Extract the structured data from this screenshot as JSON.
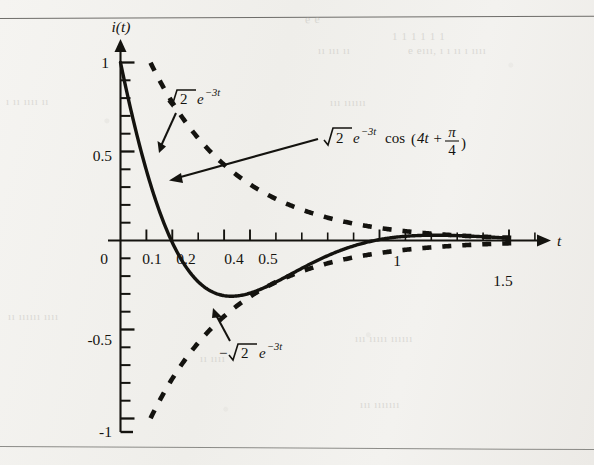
{
  "figure": {
    "kind": "damped-sinusoid-plot",
    "paper_color": "#f2f1ee",
    "ink_color": "#14130f",
    "axis": {
      "y_axis_label": "i(t)",
      "x_axis_label": "t",
      "x_ticks_labeled": [
        "0",
        "0.1",
        "0.2",
        "0.4",
        "0.5",
        "1",
        "1.5"
      ],
      "y_ticks_labeled": [
        "1",
        "0.5",
        "-0.5",
        "-1"
      ],
      "x_minor_tick_step": "0.1",
      "y_minor_tick_step": "0.1",
      "x_range_min": "0",
      "x_range_max": "1.6",
      "y_range_min": "-1",
      "y_range_max": "1"
    },
    "annotations": {
      "upper_envelope": {
        "radical": "√2",
        "base": "e",
        "exponent": "−3t",
        "full": "√2 e^{-3t}",
        "style": "dashed"
      },
      "lower_envelope": {
        "sign": "−",
        "radical": "√2",
        "base": "e",
        "exponent": "−3t",
        "full": "−√2 e^{-3t}",
        "style": "dashed"
      },
      "main_curve": {
        "radical": "√2",
        "base": "e",
        "exponent": "−3t",
        "trig": "cos",
        "arg_open": "(",
        "arg_main": "4t +",
        "frac_num": "π",
        "frac_den": "4",
        "arg_close": ")",
        "full": "√2 e^{-3t} cos(4t + π/4)",
        "style": "solid"
      }
    },
    "bleed_through_marks": [
      {
        "text": "e e",
        "x": 305,
        "y": 12,
        "size": 12,
        "rot": -1
      },
      {
        "text": "1 1 1 1 1 1",
        "x": 392,
        "y": 30,
        "size": 11,
        "rot": 0
      },
      {
        "text": "ıı ııı ıı",
        "x": 318,
        "y": 44,
        "size": 11,
        "rot": 0
      },
      {
        "text": "e eııı, ı ı ıı ı ıııı",
        "x": 408,
        "y": 44,
        "size": 11,
        "rot": 0
      },
      {
        "text": "ı ıı ıııı ıı",
        "x": 6,
        "y": 95,
        "size": 11,
        "rot": 0
      },
      {
        "text": "ııı ıııııı",
        "x": 330,
        "y": 96,
        "size": 11,
        "rot": 0
      },
      {
        "text": "ıı ıııııı ıııı",
        "x": 8,
        "y": 310,
        "size": 11,
        "rot": 0
      },
      {
        "text": "ııı ııııı ıııııı",
        "x": 355,
        "y": 332,
        "size": 11,
        "rot": 0
      },
      {
        "text": "ııı ııııııı",
        "x": 360,
        "y": 398,
        "size": 11,
        "rot": 0
      },
      {
        "text": "ıı ıııı",
        "x": 200,
        "y": 352,
        "size": 11,
        "rot": 0
      }
    ]
  },
  "chart_data": {
    "type": "line",
    "title": "",
    "xlabel": "t",
    "ylabel": "i(t)",
    "xlim": [
      0,
      1.6
    ],
    "ylim": [
      -1,
      1
    ],
    "grid": false,
    "legend": "inline-annotations",
    "xticks": [
      0,
      0.1,
      0.2,
      0.3,
      0.4,
      0.5,
      0.6,
      0.7,
      0.8,
      0.9,
      1.0,
      1.1,
      1.2,
      1.3,
      1.4,
      1.5,
      1.6
    ],
    "xtick_labels": [
      "0",
      "0.1",
      "0.2",
      "",
      "0.4",
      "0.5",
      "",
      "",
      "",
      "",
      "1",
      "",
      "",
      "",
      "",
      "1.5",
      ""
    ],
    "yticks": [
      -1,
      -0.9,
      -0.8,
      -0.7,
      -0.6,
      -0.5,
      -0.4,
      -0.3,
      -0.2,
      -0.1,
      0,
      0.1,
      0.2,
      0.3,
      0.4,
      0.5,
      0.6,
      0.7,
      0.8,
      0.9,
      1.0
    ],
    "ytick_labels": [
      "-1",
      "",
      "",
      "",
      "",
      "-0.5",
      "",
      "",
      "",
      "",
      "",
      "",
      "",
      "",
      "",
      "0.5",
      "",
      "",
      "",
      "",
      "1"
    ],
    "series": [
      {
        "name": "√2 e^{-3t} cos(4t + π/4)",
        "style": "solid",
        "formula_sqrt2": 1.41421356,
        "formula_decay": 3,
        "formula_omega": 4,
        "formula_phase_pi_over": 4,
        "x": [
          0.0,
          0.05,
          0.1,
          0.15,
          0.2,
          0.25,
          0.3,
          0.35,
          0.4,
          0.45,
          0.5,
          0.55,
          0.6,
          0.65,
          0.7,
          0.75,
          0.8,
          0.85,
          0.9,
          0.95,
          1.0,
          1.05,
          1.1,
          1.15,
          1.2,
          1.25,
          1.3,
          1.35,
          1.4,
          1.45,
          1.5,
          1.55,
          1.6
        ],
        "y": [
          1.0,
          0.823,
          0.639,
          0.462,
          0.3,
          0.159,
          0.043,
          -0.048,
          -0.113,
          -0.156,
          -0.179,
          -0.186,
          -0.181,
          -0.168,
          -0.149,
          -0.127,
          -0.104,
          -0.081,
          -0.059,
          -0.039,
          -0.022,
          -0.007,
          0.005,
          0.014,
          0.021,
          0.025,
          0.028,
          0.029,
          0.029,
          0.028,
          0.026,
          0.024,
          0.021
        ]
      },
      {
        "name": "√2 e^{-3t}",
        "style": "dashed",
        "x": [
          0.0,
          0.1,
          0.2,
          0.3,
          0.4,
          0.5,
          0.6,
          0.7,
          0.8,
          0.9,
          1.0,
          1.1,
          1.2,
          1.3,
          1.4,
          1.5,
          1.6
        ],
        "y": [
          1.414,
          1.048,
          0.776,
          0.575,
          0.426,
          0.316,
          0.234,
          0.173,
          0.128,
          0.095,
          0.07,
          0.052,
          0.039,
          0.029,
          0.021,
          0.016,
          0.012
        ]
      },
      {
        "name": "−√2 e^{-3t}",
        "style": "dashed",
        "x": [
          0.0,
          0.1,
          0.2,
          0.3,
          0.4,
          0.5,
          0.6,
          0.7,
          0.8,
          0.9,
          1.0,
          1.1,
          1.2,
          1.3,
          1.4,
          1.5,
          1.6
        ],
        "y": [
          -1.414,
          -1.048,
          -0.776,
          -0.575,
          -0.426,
          -0.316,
          -0.234,
          -0.173,
          -0.128,
          -0.095,
          -0.07,
          -0.052,
          -0.039,
          -0.029,
          -0.021,
          -0.016,
          -0.012
        ]
      }
    ]
  }
}
